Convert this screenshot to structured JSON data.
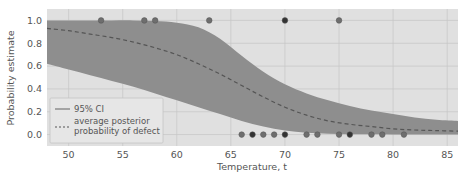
{
  "chart_data": {
    "type": "line",
    "title": "",
    "xlabel": "Temperature, t",
    "ylabel": "Probability estimate",
    "xlim": [
      48,
      86
    ],
    "ylim": [
      -0.1,
      1.1
    ],
    "xticks": [
      50,
      55,
      60,
      65,
      70,
      75,
      80,
      85
    ],
    "yticks": [
      0.0,
      0.2,
      0.4,
      0.6,
      0.8,
      1.0
    ],
    "xtick_labels": [
      "50",
      "55",
      "60",
      "65",
      "70",
      "75",
      "80",
      "85"
    ],
    "ytick_labels": [
      "0.0",
      "0.2",
      "0.4",
      "0.6",
      "0.8",
      "1.0"
    ],
    "grid": true,
    "legend_position": "lower left",
    "legend": [
      {
        "label": "95% CI",
        "style": "solid-band"
      },
      {
        "label": "average posterior\nprobability of defect",
        "style": "dashed"
      }
    ],
    "series": [
      {
        "name": "average posterior probability of defect",
        "style": "dashed",
        "x": [
          48,
          50,
          52,
          54,
          56,
          58,
          60,
          62,
          64,
          66,
          68,
          70,
          72,
          74,
          76,
          78,
          80,
          82,
          84,
          86
        ],
        "y": [
          0.93,
          0.91,
          0.88,
          0.85,
          0.81,
          0.76,
          0.7,
          0.62,
          0.53,
          0.43,
          0.33,
          0.24,
          0.17,
          0.12,
          0.09,
          0.07,
          0.05,
          0.04,
          0.035,
          0.03
        ]
      },
      {
        "name": "95% CI upper",
        "style": "band-upper",
        "x": [
          48,
          50,
          52,
          54,
          56,
          58,
          60,
          62,
          64,
          66,
          68,
          70,
          72,
          74,
          76,
          78,
          80,
          82,
          84,
          86
        ],
        "y": [
          1.0,
          1.0,
          1.0,
          1.0,
          1.0,
          0.995,
          0.98,
          0.94,
          0.84,
          0.69,
          0.55,
          0.44,
          0.36,
          0.3,
          0.25,
          0.21,
          0.18,
          0.15,
          0.13,
          0.12
        ]
      },
      {
        "name": "95% CI lower",
        "style": "band-lower",
        "x": [
          48,
          50,
          52,
          54,
          56,
          58,
          60,
          62,
          64,
          66,
          68,
          70,
          72,
          74,
          76,
          78,
          80,
          82,
          84,
          86
        ],
        "y": [
          0.62,
          0.57,
          0.52,
          0.47,
          0.42,
          0.36,
          0.3,
          0.24,
          0.18,
          0.12,
          0.07,
          0.035,
          0.015,
          0.007,
          0.003,
          0.002,
          0.001,
          0.0,
          0.0,
          0.0
        ]
      },
      {
        "name": "observed defects",
        "style": "scatter",
        "points": [
          {
            "x": 53,
            "y": 1
          },
          {
            "x": 57,
            "y": 1
          },
          {
            "x": 58,
            "y": 1
          },
          {
            "x": 63,
            "y": 1
          },
          {
            "x": 70,
            "y": 1
          },
          {
            "x": 75,
            "y": 1
          },
          {
            "x": 66,
            "y": 0
          },
          {
            "x": 67,
            "y": 0
          },
          {
            "x": 68,
            "y": 0
          },
          {
            "x": 69,
            "y": 0
          },
          {
            "x": 70,
            "y": 0
          },
          {
            "x": 72,
            "y": 0
          },
          {
            "x": 73,
            "y": 0
          },
          {
            "x": 75,
            "y": 0
          },
          {
            "x": 76,
            "y": 0
          },
          {
            "x": 78,
            "y": 0
          },
          {
            "x": 79,
            "y": 0
          },
          {
            "x": 81,
            "y": 0
          }
        ],
        "dark_points": [
          {
            "x": 70,
            "y": 1
          },
          {
            "x": 67,
            "y": 0
          },
          {
            "x": 70,
            "y": 0
          },
          {
            "x": 76,
            "y": 0
          }
        ]
      }
    ]
  },
  "colors": {
    "plot_bg": "#e0e0e0",
    "grid": "#c8c8c8",
    "band": "#8e8e8e",
    "mean_line": "#555555",
    "point": "#6e6e6e",
    "point_dark": "#333333",
    "text": "#555555"
  }
}
